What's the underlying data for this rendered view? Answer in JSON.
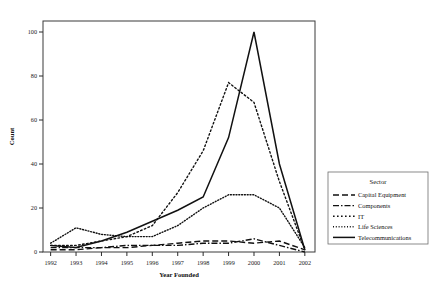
{
  "chart_data": {
    "type": "line",
    "title": "",
    "xlabel": "Year Founded",
    "ylabel": "Count",
    "x": [
      1992,
      1993,
      1994,
      1995,
      1996,
      1997,
      1998,
      1999,
      2000,
      2001,
      2002
    ],
    "xtick_labels": [
      "1992",
      "1993",
      "1994",
      "1995",
      "1996",
      "1997",
      "1998",
      "1999",
      "2000",
      "2001",
      "2002"
    ],
    "ytick_labels": [
      "0",
      "20",
      "40",
      "60",
      "80",
      "100"
    ],
    "yticks": [
      0,
      20,
      40,
      60,
      80,
      100
    ],
    "ylim": [
      0,
      105
    ],
    "xlim": [
      1991.7,
      2002.4
    ],
    "grid": false,
    "legend_position": "right",
    "legend_title": "Sector",
    "series": [
      {
        "name": "Capital Equipment",
        "linestyle": "long-dash",
        "dasharray": "6 3",
        "values": [
          1,
          1,
          2,
          2,
          3,
          4,
          5,
          5,
          4,
          5,
          1
        ]
      },
      {
        "name": "Components",
        "linestyle": "dash-dot",
        "dasharray": "6 2 1.5 2",
        "values": [
          2,
          2,
          2,
          3,
          3,
          3,
          4,
          4,
          6,
          3,
          0
        ]
      },
      {
        "name": "IT",
        "linestyle": "dotted",
        "dasharray": "1.6 2.4",
        "values": [
          3,
          3,
          5,
          7,
          12,
          27,
          46,
          77,
          68,
          32,
          1
        ]
      },
      {
        "name": "Life Sciences",
        "linestyle": "fine-dotted",
        "dasharray": "1 1.8",
        "values": [
          4,
          11,
          8,
          7,
          7,
          12,
          20,
          26,
          26,
          20,
          2
        ]
      },
      {
        "name": "Telecommunications",
        "linestyle": "solid",
        "dasharray": "0",
        "values": [
          3,
          2,
          5,
          9,
          14,
          19,
          25,
          52,
          100,
          40,
          1
        ]
      }
    ],
    "colors": {
      "series": "#111111",
      "axis": "#2b2b2b",
      "background": "#ffffff"
    }
  }
}
